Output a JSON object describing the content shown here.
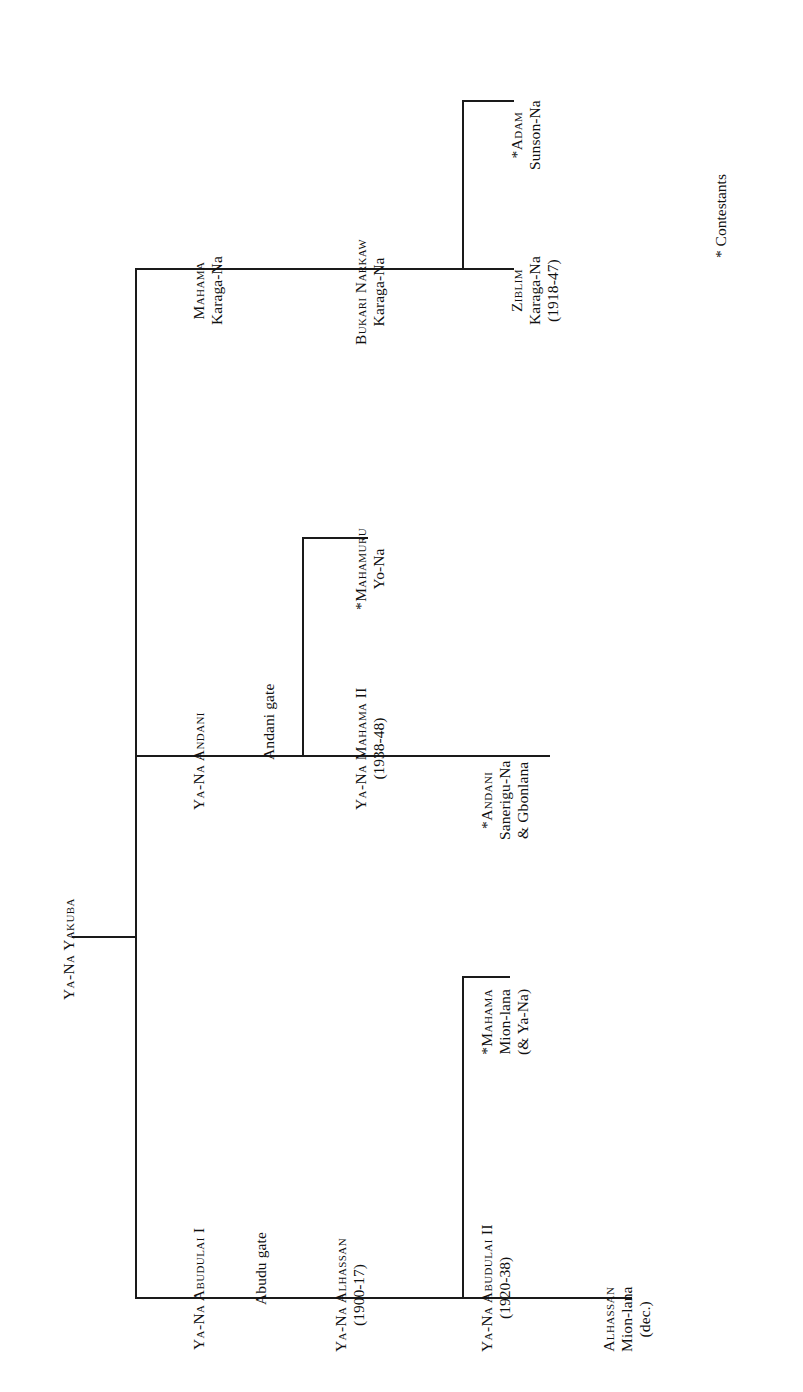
{
  "figure": {
    "type": "genealogy-tree",
    "orientation": "rotated-90-ccw",
    "line_color": "#1a1a1a",
    "background": "#ffffff"
  },
  "root": {
    "id": "ya-na-yakuba",
    "name": "Ya-Na Yakuba"
  },
  "gates": {
    "abudu": "Abudu gate",
    "andani": "Andani gate"
  },
  "nodes": {
    "abudulai_1": {
      "name": "Ya-Na Abudulai I",
      "dates": ""
    },
    "alhassan": {
      "name": "Ya-Na Alhassan",
      "dates": "(1900-17)"
    },
    "abudulai_2": {
      "name": "Ya-Na Abudulai II",
      "dates": "(1920-38)"
    },
    "mahama_mion": {
      "star": "*",
      "name": "Mahama",
      "line2": "Mion-lana",
      "line3": "(& Ya-Na)"
    },
    "alhassan_mion": {
      "name": "Alhassan",
      "line2": "Mion-lana",
      "line3": "(dec.)"
    },
    "andani": {
      "name": "Ya-Na Andani",
      "dates": ""
    },
    "mahama_2": {
      "name": "Ya-Na Mahama II",
      "dates": "(1938-48)"
    },
    "mahamuru": {
      "star": "*",
      "name": "Mahamuru",
      "line2": "Yo-Na"
    },
    "andani_sanerigu": {
      "star": "*",
      "name": "Andani",
      "line2": "Sanerigu-Na",
      "line3": "& Gbonlana"
    },
    "mahama_karaga": {
      "name": "Mahama",
      "line2": "Karaga-Na"
    },
    "bukari_narkaw": {
      "name": "Bukari Narkaw",
      "line2": "Karaga-Na"
    },
    "ziblim_karaga": {
      "name": "Ziblim",
      "line2": "Karaga-Na",
      "line3": "(1918-47)"
    },
    "adam_sunson": {
      "star": "*",
      "name": "Adam",
      "line2": "Sunson-Na"
    }
  },
  "legend": {
    "marker": "*",
    "label": "Contestants"
  }
}
